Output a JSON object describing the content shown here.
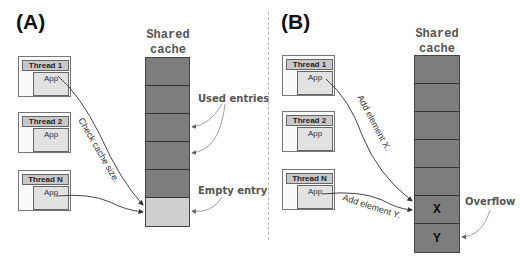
{
  "panels": [
    {
      "label": "(A)",
      "cache_title": [
        "Shared",
        "cache"
      ],
      "threads": [
        {
          "name": "Thread 1",
          "app": "App"
        },
        {
          "name": "Thread 2",
          "app": "App"
        },
        {
          "name": "Thread N",
          "app": "App"
        }
      ],
      "cache_cells": [
        {
          "state": "used",
          "content": ""
        },
        {
          "state": "used",
          "content": ""
        },
        {
          "state": "used",
          "content": ""
        },
        {
          "state": "used",
          "content": ""
        },
        {
          "state": "used",
          "content": ""
        },
        {
          "state": "empty",
          "content": ""
        }
      ],
      "arrow_labels": [
        "Check cache size."
      ],
      "callouts": [
        "Used entries",
        "Empty entry"
      ]
    },
    {
      "label": "(B)",
      "cache_title": [
        "Shared",
        "cache"
      ],
      "threads": [
        {
          "name": "Thread 1",
          "app": "App"
        },
        {
          "name": "Thread 2",
          "app": "App"
        },
        {
          "name": "Thread N",
          "app": "App"
        }
      ],
      "cache_cells": [
        {
          "state": "used",
          "content": ""
        },
        {
          "state": "used",
          "content": ""
        },
        {
          "state": "used",
          "content": ""
        },
        {
          "state": "used",
          "content": ""
        },
        {
          "state": "used",
          "content": ""
        },
        {
          "state": "used",
          "content": "X"
        },
        {
          "state": "overflow",
          "content": "Y"
        }
      ],
      "arrow_labels": [
        "Add element X.",
        "Add element Y."
      ],
      "callouts": [
        "Overflow"
      ]
    }
  ],
  "colors": {
    "used_cell": "#7d7d7d",
    "empty_cell": "#cfcfcf",
    "thread_header": "#c8c8c8",
    "app_box": "#e2e2e2"
  }
}
